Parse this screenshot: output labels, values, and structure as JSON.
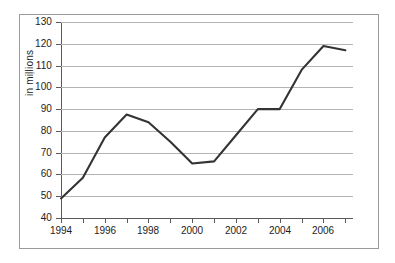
{
  "chart_data": {
    "type": "line",
    "title": "",
    "xlabel": "",
    "ylabel": "in millions",
    "x": [
      1994,
      1995,
      1996,
      1997,
      1998,
      1999,
      2000,
      2001,
      2002,
      2003,
      2004,
      2005,
      2006,
      2007
    ],
    "values": [
      49,
      58.5,
      77,
      87.5,
      84,
      75,
      65,
      66,
      78,
      90,
      90,
      108,
      119,
      117
    ],
    "series": [
      {
        "name": "in millions",
        "values": [
          49,
          58.5,
          77,
          87.5,
          84,
          75,
          65,
          66,
          78,
          90,
          90,
          108,
          119,
          117
        ]
      }
    ],
    "xlim": [
      1994,
      2007.35
    ],
    "ylim": [
      40,
      130
    ],
    "ytick_labels": [
      "130",
      "120",
      "110",
      "100",
      "90",
      "80",
      "70",
      "60",
      "50",
      "40"
    ],
    "ytick_values": [
      130,
      120,
      110,
      100,
      90,
      80,
      70,
      60,
      50,
      40
    ],
    "xtick_values": [
      1994,
      1995,
      1996,
      1997,
      1998,
      1999,
      2000,
      2001,
      2002,
      2003,
      2004,
      2005,
      2006,
      2007
    ],
    "xtick_labels": [
      "1994",
      "",
      "1996",
      "",
      "1998",
      "",
      "2000",
      "",
      "2002",
      "",
      "2004",
      "",
      "2006",
      ""
    ],
    "grid": true,
    "legend": false,
    "legend_position": "none",
    "line_color": "#333333",
    "grid_color": "#b4b4b4",
    "axis_color": "#5a5a5a",
    "background_color": "#ffffff",
    "frame_color": "#9a9a9a"
  }
}
